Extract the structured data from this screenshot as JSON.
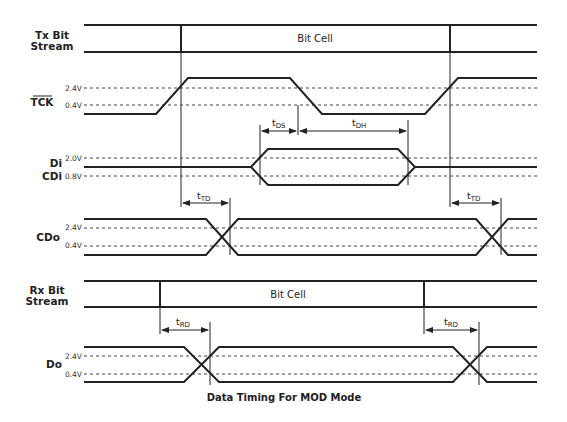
{
  "diagram": {
    "caption": "Data Timing For MOD Mode",
    "signals": [
      {
        "id": "tx",
        "label_line1": "Tx Bit",
        "label_line2": "Stream"
      },
      {
        "id": "tck",
        "label": "TCK",
        "overline": true,
        "levels": [
          "2.4V",
          "0.4V"
        ]
      },
      {
        "id": "di",
        "label_line1": "Di",
        "label_line2": "CDi",
        "levels": [
          "2.0V",
          "0.8V"
        ]
      },
      {
        "id": "cdo",
        "label": "CDo",
        "levels": [
          "2.4V",
          "0.4V"
        ]
      },
      {
        "id": "rx",
        "label_line1": "Rx Bit",
        "label_line2": "Stream"
      },
      {
        "id": "do",
        "label": "Do",
        "levels": [
          "2.4V",
          "0.4V"
        ]
      }
    ],
    "tx_cell_label": "Bit Cell",
    "rx_cell_label": "Bit Cell",
    "timings": {
      "tds": {
        "t": "t",
        "sub": "DS"
      },
      "tdh": {
        "t": "t",
        "sub": "DH"
      },
      "ttd1": {
        "t": "t",
        "sub": "TD"
      },
      "ttd2": {
        "t": "t",
        "sub": "TD"
      },
      "trd1": {
        "t": "t",
        "sub": "RD"
      },
      "trd2": {
        "t": "t",
        "sub": "RD"
      }
    }
  }
}
